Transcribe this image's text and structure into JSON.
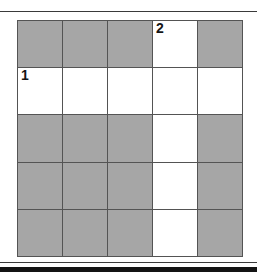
{
  "figure": {
    "type": "grid-diagram",
    "rows": 5,
    "columns": 5,
    "colors": {
      "shaded_cell": "#a8a8a8",
      "empty_cell": "#ffffff",
      "grid_line": "#545454",
      "rule": "#1a1a1a",
      "label_text": "#151515"
    },
    "rules": {
      "top": "horizontal-rule",
      "bottom_thin": "horizontal-rule",
      "bottom_thick": "horizontal-rule"
    },
    "cells": [
      [
        {
          "state": "shaded",
          "label": ""
        },
        {
          "state": "shaded",
          "label": ""
        },
        {
          "state": "shaded",
          "label": ""
        },
        {
          "state": "empty",
          "label": "2"
        },
        {
          "state": "shaded",
          "label": ""
        }
      ],
      [
        {
          "state": "empty",
          "label": "1"
        },
        {
          "state": "empty",
          "label": ""
        },
        {
          "state": "empty",
          "label": ""
        },
        {
          "state": "empty",
          "label": ""
        },
        {
          "state": "empty",
          "label": ""
        }
      ],
      [
        {
          "state": "shaded",
          "label": ""
        },
        {
          "state": "shaded",
          "label": ""
        },
        {
          "state": "shaded",
          "label": ""
        },
        {
          "state": "empty",
          "label": ""
        },
        {
          "state": "shaded",
          "label": ""
        }
      ],
      [
        {
          "state": "shaded",
          "label": ""
        },
        {
          "state": "shaded",
          "label": ""
        },
        {
          "state": "shaded",
          "label": ""
        },
        {
          "state": "empty",
          "label": ""
        },
        {
          "state": "shaded",
          "label": ""
        }
      ],
      [
        {
          "state": "shaded",
          "label": ""
        },
        {
          "state": "shaded",
          "label": ""
        },
        {
          "state": "shaded",
          "label": ""
        },
        {
          "state": "empty",
          "label": ""
        },
        {
          "state": "shaded",
          "label": ""
        }
      ]
    ]
  }
}
